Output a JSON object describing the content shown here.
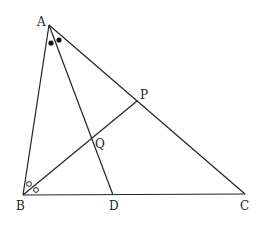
{
  "diagram": {
    "type": "geometry",
    "points": {
      "A": {
        "label": "A",
        "x": 49,
        "y": 25
      },
      "B": {
        "label": "B",
        "x": 23,
        "y": 195
      },
      "C": {
        "label": "C",
        "x": 245,
        "y": 194
      },
      "D": {
        "label": "D",
        "x": 113,
        "y": 195
      },
      "P": {
        "label": "P",
        "x": 137,
        "y": 101
      },
      "Q": {
        "label": "Q",
        "x": 92,
        "y": 140
      }
    },
    "segments": [
      "AB",
      "BC",
      "CA",
      "AD",
      "BP"
    ],
    "angle_marks": {
      "A": "filled dots (equal angles BAD and DAC)",
      "B": "open circles (equal angles ABP and PBC)"
    },
    "colors": {
      "stroke": "#222222",
      "background": "#ffffff"
    }
  }
}
